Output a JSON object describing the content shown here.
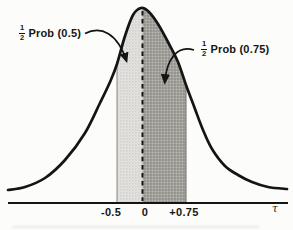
{
  "chart_data": {
    "type": "area",
    "x_axis": {
      "symbol": "τ",
      "tick_labels": [
        "-0.5",
        "0",
        "+0.75"
      ],
      "tick_values": [
        -0.5,
        0,
        0.75
      ]
    },
    "center_dashed_line_x": 0,
    "regions": [
      {
        "range": [
          -0.5,
          0
        ],
        "shade": "light-stipple",
        "annotation": "1/2 Prob (0.5)"
      },
      {
        "range": [
          0,
          0.75
        ],
        "shade": "dark-stipple",
        "annotation": "1/2 Prob (0.75)"
      }
    ],
    "curve_points_px": [
      [
        8,
        190
      ],
      [
        25,
        187
      ],
      [
        45,
        178
      ],
      [
        65,
        160
      ],
      [
        85,
        133
      ],
      [
        100,
        103
      ],
      [
        110,
        82
      ],
      [
        117,
        64
      ],
      [
        125,
        36
      ],
      [
        133,
        15
      ],
      [
        141,
        8
      ],
      [
        149,
        12
      ],
      [
        158,
        24
      ],
      [
        168,
        42
      ],
      [
        178,
        62
      ],
      [
        186,
        85
      ],
      [
        195,
        109
      ],
      [
        203,
        130
      ],
      [
        212,
        149
      ],
      [
        225,
        166
      ],
      [
        238,
        175
      ],
      [
        252,
        182
      ],
      [
        268,
        187
      ],
      [
        287,
        189
      ]
    ],
    "baseline_y_px": 202
  },
  "annotations": {
    "left": {
      "frac_num": "1",
      "frac_den": "2",
      "text": "Prob (0.5)"
    },
    "right": {
      "frac_num": "1",
      "frac_den": "2",
      "text": "Prob (0.75)"
    }
  },
  "axis": {
    "ticks": [
      "-0.5",
      "0",
      "+0.75"
    ],
    "symbol": "τ"
  },
  "colors": {
    "ink": "#141414",
    "light_shade": "#d9d8d3",
    "dark_shade": "#9e9d98",
    "background": "#fcfcfa"
  }
}
